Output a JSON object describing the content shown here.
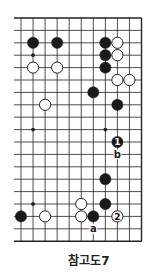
{
  "diagram": {
    "title": "참고도7",
    "grid": {
      "cols": 11,
      "rows": 19,
      "x0": 21,
      "y0": 18,
      "dx": 12.05,
      "dy": 12.4,
      "left_extension": 7,
      "line_color": "#222222",
      "edges": {
        "top": true,
        "bottom": true,
        "right": true,
        "left": false
      }
    },
    "hoshi": [
      {
        "col": 1,
        "row": 3
      },
      {
        "col": 1,
        "row": 9
      },
      {
        "col": 7,
        "row": 9
      },
      {
        "col": 1,
        "row": 15
      }
    ],
    "stones": [
      {
        "color": "black",
        "col": 1,
        "row": 2
      },
      {
        "color": "black",
        "col": 3,
        "row": 2
      },
      {
        "color": "black",
        "col": 7,
        "row": 2
      },
      {
        "color": "white",
        "col": 8,
        "row": 2
      },
      {
        "color": "black",
        "col": 7,
        "row": 3
      },
      {
        "color": "white",
        "col": 8,
        "row": 3
      },
      {
        "color": "white",
        "col": 1,
        "row": 4
      },
      {
        "color": "white",
        "col": 3,
        "row": 4
      },
      {
        "color": "black",
        "col": 7,
        "row": 4
      },
      {
        "color": "white",
        "col": 8,
        "row": 5
      },
      {
        "color": "white",
        "col": 9,
        "row": 5
      },
      {
        "color": "black",
        "col": 6,
        "row": 6
      },
      {
        "color": "white",
        "col": 2,
        "row": 7
      },
      {
        "color": "black",
        "col": 8,
        "row": 7
      },
      {
        "color": "black",
        "col": 8,
        "row": 10,
        "label": "1"
      },
      {
        "color": "black",
        "col": 7,
        "row": 13
      },
      {
        "color": "white",
        "col": 5,
        "row": 15
      },
      {
        "color": "black",
        "col": 7,
        "row": 15
      },
      {
        "color": "black",
        "col": 0,
        "row": 16
      },
      {
        "color": "white",
        "col": 2,
        "row": 16
      },
      {
        "color": "white",
        "col": 5,
        "row": 16
      },
      {
        "color": "black",
        "col": 6,
        "row": 16
      },
      {
        "color": "white",
        "col": 8,
        "row": 16,
        "label": "2"
      }
    ],
    "markers": [
      {
        "label": "b",
        "col": 8,
        "row": 11
      },
      {
        "label": "a",
        "col": 6,
        "row": 17
      }
    ],
    "colors": {
      "black_stone": "#1a1a1a",
      "white_stone": "#ffffff",
      "stone_outline": "#222222",
      "background": "#ffffff"
    }
  }
}
